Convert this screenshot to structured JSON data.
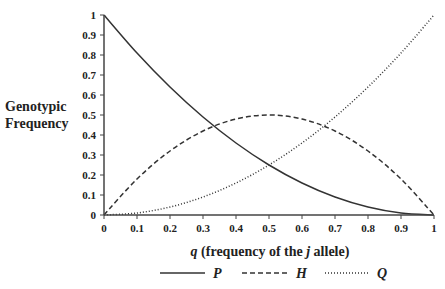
{
  "chart_data": {
    "type": "line",
    "title": "",
    "xlabel": "q (frequency of the j allele)",
    "xlabel_parts": {
      "var": "q",
      "pre": " (frequency of the ",
      "italic": "j",
      "post": " allele)"
    },
    "ylabel": "Genotypic Frequency",
    "ylabel_lines": [
      "Genotypic",
      "Frequency"
    ],
    "xlim": [
      0,
      1
    ],
    "ylim": [
      0,
      1
    ],
    "grid": false,
    "legend_position": "bottom",
    "x_ticks": [
      "0",
      "0.1",
      "0.2",
      "0.3",
      "0.4",
      "0.5",
      "0.6",
      "0.7",
      "0.8",
      "0.9",
      "1"
    ],
    "y_ticks": [
      "0",
      "0.1",
      "0.2",
      "0.3",
      "0.4",
      "0.5",
      "0.6",
      "0.7",
      "0.8",
      "0.9",
      "1"
    ],
    "x": [
      0,
      0.1,
      0.2,
      0.3,
      0.4,
      0.5,
      0.6,
      0.7,
      0.8,
      0.9,
      1.0
    ],
    "series": [
      {
        "name": "P",
        "style": "solid",
        "formula": "(1-q)^2",
        "values": [
          1.0,
          0.81,
          0.64,
          0.49,
          0.36,
          0.25,
          0.16,
          0.09,
          0.04,
          0.01,
          0.0
        ]
      },
      {
        "name": "H",
        "style": "dashed",
        "formula": "2q(1-q)",
        "values": [
          0.0,
          0.18,
          0.32,
          0.42,
          0.48,
          0.5,
          0.48,
          0.42,
          0.32,
          0.18,
          0.0
        ]
      },
      {
        "name": "Q",
        "style": "dotted",
        "formula": "q^2",
        "values": [
          0.0,
          0.01,
          0.04,
          0.09,
          0.16,
          0.25,
          0.36,
          0.49,
          0.64,
          0.81,
          1.0
        ]
      }
    ]
  },
  "colors": {
    "line": "#333333",
    "axis": "#444444",
    "text": "#222222"
  }
}
